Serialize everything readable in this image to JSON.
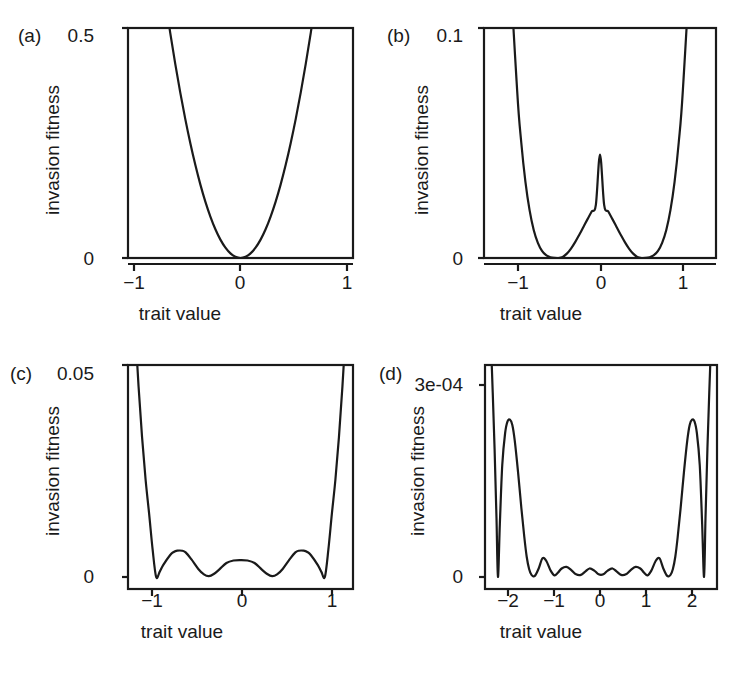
{
  "figure": {
    "background_color": "#ffffff",
    "line_color": "#1a1a1a",
    "axis_color": "#1a1a1a",
    "panel_count": 4
  },
  "chart_data": [
    {
      "type": "line",
      "panel": "(a)",
      "title": "",
      "xlabel": "trait value",
      "ylabel": "invasion fitness",
      "xlim": [
        -1.12,
        1.12
      ],
      "ylim": [
        0,
        0.5
      ],
      "xticks": [
        -1,
        0,
        1
      ],
      "xticklabels": [
        "−1",
        "0",
        "1"
      ],
      "yticks": [
        0,
        0.5
      ],
      "yticklabels": [
        "0",
        "0.5"
      ],
      "grid": false,
      "legend": "none",
      "x": [
        -1.12,
        -1.05,
        -1.0,
        -0.95,
        -0.9,
        -0.85,
        -0.8,
        -0.75,
        -0.7,
        -0.65,
        -0.6,
        -0.55,
        -0.5,
        -0.45,
        -0.4,
        -0.35,
        -0.3,
        -0.25,
        -0.2,
        -0.15,
        -0.1,
        -0.05,
        0.0,
        0.05,
        0.1,
        0.15,
        0.2,
        0.25,
        0.3,
        0.35,
        0.4,
        0.45,
        0.5,
        0.55,
        0.6,
        0.65,
        0.7,
        0.75,
        0.8,
        0.85,
        0.9,
        0.95,
        1.0,
        1.05,
        1.12
      ],
      "y": [
        1.2544,
        1.1025,
        1.0,
        0.9025,
        0.81,
        0.7225,
        0.64,
        0.5625,
        0.49,
        0.4225,
        0.36,
        0.3025,
        0.25,
        0.2025,
        0.16,
        0.1225,
        0.09,
        0.0625,
        0.04,
        0.0225,
        0.01,
        0.0025,
        0.0,
        0.0025,
        0.01,
        0.0225,
        0.04,
        0.0625,
        0.09,
        0.1225,
        0.16,
        0.2025,
        0.25,
        0.3025,
        0.36,
        0.4225,
        0.49,
        0.5625,
        0.64,
        0.7225,
        0.81,
        0.9025,
        1.0,
        1.1025,
        1.2544
      ]
    },
    {
      "type": "line",
      "panel": "(b)",
      "title": "",
      "xlabel": "trait value",
      "ylabel": "invasion fitness",
      "xlim": [
        -1.4,
        1.4
      ],
      "ylim": [
        0,
        0.1
      ],
      "xticks": [
        -1,
        0,
        1
      ],
      "xticklabels": [
        "−1",
        "0",
        "1"
      ],
      "yticks": [
        0,
        0.1
      ],
      "yticklabels": [
        "0",
        "0.1"
      ],
      "grid": false,
      "legend": "none",
      "minima": [
        -0.5,
        0.5
      ],
      "central_peak": {
        "x": 0,
        "y": 0.045
      },
      "x": [
        -1.4,
        -1.3,
        -1.2,
        -1.1,
        -1.0,
        -0.95,
        -0.9,
        -0.85,
        -0.8,
        -0.75,
        -0.7,
        -0.65,
        -0.6,
        -0.55,
        -0.5,
        -0.45,
        -0.4,
        -0.35,
        -0.3,
        -0.25,
        -0.2,
        -0.15,
        -0.1,
        -0.05,
        0.0,
        0.05,
        0.1,
        0.15,
        0.2,
        0.25,
        0.3,
        0.35,
        0.4,
        0.45,
        0.5,
        0.55,
        0.6,
        0.65,
        0.7,
        0.75,
        0.8,
        0.85,
        0.9,
        0.95,
        1.0,
        1.1,
        1.2,
        1.3,
        1.4
      ],
      "y": [
        0.5717,
        0.3781,
        0.2371,
        0.1389,
        0.0729,
        0.0501,
        0.0331,
        0.0208,
        0.0122,
        0.0066,
        0.0031,
        0.0012,
        0.0003,
        2e-05,
        0.0,
        0.0005,
        0.0019,
        0.0041,
        0.0069,
        0.0101,
        0.0135,
        0.0169,
        0.0202,
        0.0231,
        0.045,
        0.0231,
        0.0202,
        0.0169,
        0.0135,
        0.0101,
        0.0069,
        0.0041,
        0.0019,
        0.0005,
        0.0,
        2e-05,
        0.0003,
        0.0012,
        0.0031,
        0.0066,
        0.0122,
        0.0208,
        0.0331,
        0.0501,
        0.0729,
        0.1389,
        0.2371,
        0.3781,
        0.5717
      ]
    },
    {
      "type": "line",
      "panel": "(c)",
      "title": "",
      "xlabel": "trait value",
      "ylabel": "invasion fitness",
      "xlim": [
        -1.6,
        1.6
      ],
      "ylim": [
        0,
        0.05
      ],
      "xticks": [
        -1,
        0,
        1
      ],
      "xticklabels": [
        "−1",
        "0",
        "1"
      ],
      "yticks": [
        0,
        0.05
      ],
      "yticklabels": [
        "0",
        "0.05"
      ],
      "grid": false,
      "legend": "none",
      "minima": [
        -1.2,
        -0.45,
        0.45,
        1.2
      ],
      "humps": [
        {
          "x": -0.83,
          "y": 0.0062
        },
        {
          "x": 0.0,
          "y": 0.004
        },
        {
          "x": 0.83,
          "y": 0.0062
        }
      ],
      "x": [
        -1.6,
        -1.55,
        -1.5,
        -1.45,
        -1.4,
        -1.35,
        -1.3,
        -1.25,
        -1.2,
        -1.15,
        -1.1,
        -1.0,
        -0.95,
        -0.9,
        -0.83,
        -0.78,
        -0.7,
        -0.6,
        -0.52,
        -0.45,
        -0.38,
        -0.3,
        -0.2,
        -0.1,
        0.0,
        0.1,
        0.2,
        0.3,
        0.38,
        0.45,
        0.52,
        0.6,
        0.7,
        0.78,
        0.83,
        0.9,
        0.95,
        1.0,
        1.1,
        1.15,
        1.2,
        1.25,
        1.3,
        1.35,
        1.4,
        1.45,
        1.5,
        1.55,
        1.6
      ],
      "y": [
        0.093,
        0.075,
        0.059,
        0.045,
        0.033,
        0.023,
        0.015,
        0.0065,
        0.0,
        0.0012,
        0.0028,
        0.0052,
        0.0059,
        0.0062,
        0.0062,
        0.0058,
        0.0042,
        0.0019,
        0.0006,
        0.0002,
        0.0007,
        0.0018,
        0.0033,
        0.0039,
        0.004,
        0.0039,
        0.0033,
        0.0018,
        0.0007,
        0.0002,
        0.0006,
        0.0019,
        0.0042,
        0.0058,
        0.0062,
        0.0062,
        0.0059,
        0.0052,
        0.0028,
        0.0012,
        0.0,
        0.0065,
        0.015,
        0.023,
        0.033,
        0.045,
        0.059,
        0.075,
        0.093
      ]
    },
    {
      "type": "line",
      "panel": "(d)",
      "title": "",
      "xlabel": "trait value",
      "ylabel": "invasion fitness",
      "xlim": [
        -2.42,
        2.42
      ],
      "ylim": [
        0,
        0.00036
      ],
      "xticks": [
        -2,
        -1,
        0,
        1,
        2
      ],
      "xticklabels": [
        "−2",
        "−1",
        "0",
        "1",
        "2"
      ],
      "yticks": [
        0,
        0.0003
      ],
      "yticklabels": [
        "0",
        "3e-04"
      ],
      "grid": false,
      "legend": "none",
      "major_peaks": [
        {
          "x": -1.9,
          "y": 0.000295
        },
        {
          "x": 1.9,
          "y": 0.000295
        }
      ],
      "minor_peaks": [
        {
          "x": -1.22,
          "y": 3.5e-05
        },
        {
          "x": -0.72,
          "y": 1.9e-05
        },
        {
          "x": -0.24,
          "y": 1.6e-05
        },
        {
          "x": 0.24,
          "y": 1.6e-05
        },
        {
          "x": 0.72,
          "y": 1.9e-05
        },
        {
          "x": 1.22,
          "y": 3.5e-05
        }
      ],
      "zeros": [
        -2.15,
        -1.48,
        2.15,
        1.48
      ],
      "x": [
        -2.42,
        -2.35,
        -2.28,
        -2.22,
        -2.18,
        -2.15,
        -2.11,
        -2.06,
        -2.0,
        -1.95,
        -1.9,
        -1.85,
        -1.8,
        -1.73,
        -1.66,
        -1.6,
        -1.55,
        -1.5,
        -1.45,
        -1.38,
        -1.3,
        -1.22,
        -1.14,
        -1.05,
        -0.97,
        -0.9,
        -0.82,
        -0.72,
        -0.62,
        -0.52,
        -0.42,
        -0.33,
        -0.24,
        -0.14,
        -0.05,
        0.05,
        0.14,
        0.24,
        0.33,
        0.42,
        0.52,
        0.62,
        0.72,
        0.82,
        0.9,
        0.97,
        1.05,
        1.14,
        1.22,
        1.3,
        1.38,
        1.45,
        1.5,
        1.55,
        1.6,
        1.66,
        1.73,
        1.8,
        1.85,
        1.9,
        1.95,
        2.0,
        2.06,
        2.11,
        2.15,
        2.18,
        2.22,
        2.28,
        2.35,
        2.42
      ],
      "y": [
        0.00072,
        0.00056,
        0.0004,
        0.00024,
        0.00011,
        0.0,
        0.0001,
        0.00021,
        0.00027,
        0.000292,
        0.000295,
        0.000285,
        0.000256,
        0.000196,
        0.000128,
        7.5e-05,
        3.8e-05,
        1.5e-05,
        4e-06,
        2e-06,
        1.6e-05,
        3.5e-05,
        3e-05,
        1.2e-05,
        3e-06,
        8e-06,
        1.6e-05,
        1.9e-05,
        1.3e-05,
        5e-06,
        4e-06,
        1e-05,
        1.6e-05,
        1.2e-05,
        5e-06,
        5e-06,
        1.2e-05,
        1.6e-05,
        1e-05,
        4e-06,
        5e-06,
        1.3e-05,
        1.9e-05,
        1.6e-05,
        8e-06,
        3e-06,
        1.2e-05,
        3e-05,
        3.5e-05,
        1.6e-05,
        2e-06,
        4e-06,
        1.5e-05,
        3.8e-05,
        7.5e-05,
        0.000128,
        0.000196,
        0.000256,
        0.000285,
        0.000295,
        0.000292,
        0.00027,
        0.00021,
        0.0001,
        0.0,
        0.00011,
        0.00024,
        0.0004,
        0.00056,
        0.00072
      ]
    }
  ]
}
